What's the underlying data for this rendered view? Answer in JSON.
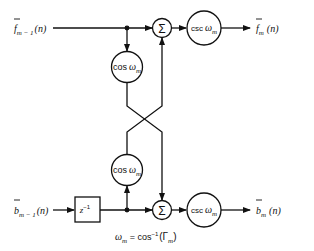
{
  "diagram": {
    "type": "lattice-filter-stage",
    "inputs": {
      "forward": {
        "base": "f",
        "sub": "m − 1",
        "arg": "(n)"
      },
      "backward": {
        "base": "b",
        "sub": "m − 1",
        "arg": "(n)"
      }
    },
    "outputs": {
      "forward": {
        "base": "f",
        "sub": "m",
        "arg": "(n)"
      },
      "backward": {
        "base": "b",
        "sub": "m",
        "arg": "(n)"
      }
    },
    "blocks": {
      "sum_symbol": "Σ",
      "cos_label": {
        "fn": "cos",
        "var": "ω",
        "sub": "m"
      },
      "csc_label": {
        "fn": "csc",
        "var": "ω",
        "sub": "m"
      },
      "delay": {
        "base": "z",
        "sup": "−1"
      }
    },
    "equation": {
      "lhs_var": "ω",
      "lhs_sub": "m",
      "eq": " = cos",
      "sup": "−1",
      "open": "(Γ",
      "arg_sub": "m",
      "close": ")"
    }
  }
}
